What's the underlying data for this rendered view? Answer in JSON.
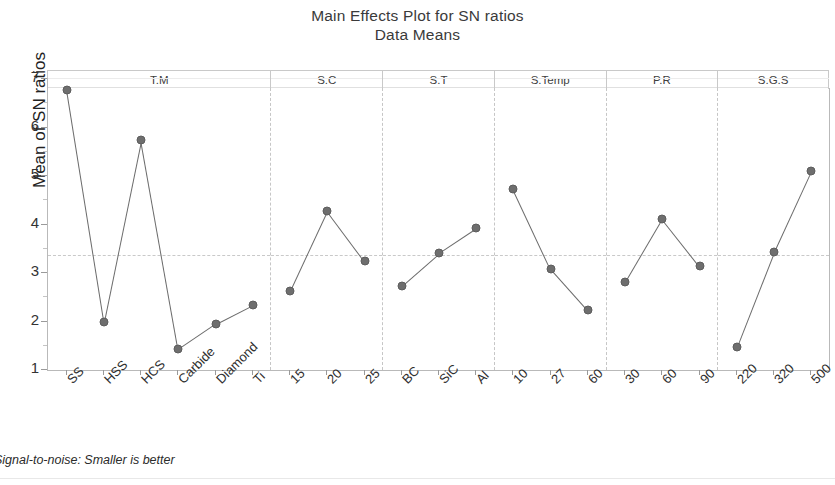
{
  "chart_data": {
    "type": "line",
    "title": "Main Effects Plot for SN ratios",
    "subtitle": "Data Means",
    "ylabel": "Mean of SN ratios",
    "xlabel": "",
    "ylim": [
      1,
      7
    ],
    "yticks": [
      1,
      2,
      3,
      4,
      5,
      6,
      7
    ],
    "grid": false,
    "legend": null,
    "reference_line": 3.35,
    "footnote": "Signal-to-noise: Smaller is better",
    "panels": [
      {
        "name": "T.M",
        "categories": [
          "SS",
          "HSS",
          "HCS",
          "Carbide",
          "Diamond",
          "Ti"
        ],
        "values": [
          6.75,
          1.97,
          5.72,
          1.41,
          1.93,
          2.32
        ]
      },
      {
        "name": "S.C",
        "categories": [
          "15",
          "20",
          "25"
        ],
        "values": [
          2.6,
          4.25,
          3.22
        ]
      },
      {
        "name": "S.T",
        "categories": [
          "BC",
          "SiC",
          "Al"
        ],
        "values": [
          2.72,
          3.39,
          3.9
        ]
      },
      {
        "name": "S.Temp",
        "categories": [
          "10",
          "27",
          "60"
        ],
        "values": [
          4.71,
          3.07,
          2.21
        ]
      },
      {
        "name": "P.R",
        "categories": [
          "30",
          "60",
          "90"
        ],
        "values": [
          2.79,
          4.1,
          3.13
        ]
      },
      {
        "name": "S.G.S",
        "categories": [
          "220",
          "320",
          "500"
        ],
        "values": [
          1.45,
          3.41,
          5.08
        ]
      }
    ],
    "colors": {
      "marker": "#6e6e6e",
      "line": "#6b6b6b",
      "reference": "#c9c9c9",
      "axis": "#b9b9b9"
    }
  }
}
